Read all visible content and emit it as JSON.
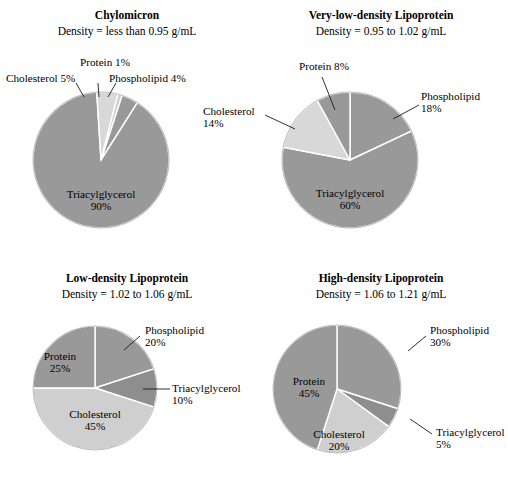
{
  "figure": {
    "background": "#ffffff",
    "palette": {
      "medium_gray": "#999999",
      "light_gray": "#cfcfcf",
      "lighter_gray": "#d8d8d8",
      "divider": "#ffffff",
      "text": "#000000",
      "leader_line": "#1a1a1a"
    }
  },
  "chart_data": [
    {
      "type": "pie",
      "id": "chylomicron",
      "title": "Chylomicron",
      "subtitle": "Density = less than 0.95 g/mL",
      "categories": [
        "Phospholipid",
        "Triacylglycerol",
        "Cholesterol",
        "Protein"
      ],
      "values": [
        4,
        90,
        5,
        1
      ],
      "labels": [
        "Phospholipid 4%",
        "Triacylglycerol 90%",
        "Cholesterol 5%",
        "Protein 1%"
      ],
      "colors": [
        "#999999",
        "#999999",
        "#d8d8d8",
        "#cfcfcf"
      ],
      "start_angle_deg": 18,
      "center": [
        101,
        160
      ],
      "radius": 68,
      "units": "percent",
      "total": 100
    },
    {
      "type": "pie",
      "id": "vldl",
      "title": "Very-low-density Lipoprotein",
      "subtitle": "Density =  0.95 to 1.02 g/mL",
      "categories": [
        "Phospholipid",
        "Triacylglycerol",
        "Cholesterol",
        "Protein"
      ],
      "values": [
        18,
        60,
        14,
        8
      ],
      "labels": [
        "Phospholipid 18%",
        "Triacylglycerol 60%",
        "Cholesterol 14%",
        "Protein 8%"
      ],
      "colors": [
        "#999999",
        "#999999",
        "#d8d8d8",
        "#999999"
      ],
      "start_angle_deg": 0,
      "center": [
        350,
        160
      ],
      "radius": 68,
      "units": "percent",
      "total": 100
    },
    {
      "type": "pie",
      "id": "ldl",
      "title": "Low-density Lipoprotein",
      "subtitle": "Density = 1.02 to 1.06 g/mL",
      "categories": [
        "Phospholipid",
        "Triacylglycerol",
        "Cholesterol",
        "Protein"
      ],
      "values": [
        20,
        10,
        45,
        25
      ],
      "labels": [
        "Phospholipid 20%",
        "Triacylglycerol 10%",
        "Cholesterol 45%",
        "Protein 25%"
      ],
      "colors": [
        "#999999",
        "#8e8e8e",
        "#cfcfcf",
        "#999999"
      ],
      "start_angle_deg": 0,
      "center": [
        95,
        388
      ],
      "radius": 62,
      "units": "percent",
      "total": 100
    },
    {
      "type": "pie",
      "id": "hdl",
      "title": "High-density Lipoprotein",
      "subtitle": "Density =  1.06 to 1.21 g/mL",
      "categories": [
        "Phospholipid",
        "Triacylglycerol",
        "Cholesterol",
        "Protein"
      ],
      "values": [
        30,
        5,
        20,
        45
      ],
      "labels": [
        "Phospholipid 30%",
        "Triacylglycerol 5%",
        "Cholesterol 20%",
        "Protein 45%"
      ],
      "colors": [
        "#999999",
        "#8e8e8e",
        "#cfcfcf",
        "#999999"
      ],
      "start_angle_deg": 0,
      "center": [
        337,
        389
      ],
      "radius": 64,
      "units": "percent",
      "total": 100
    }
  ],
  "panels": {
    "chylomicron": {
      "title": "Chylomicron",
      "density": "Density = less than 0.95 g/mL",
      "annotations": {
        "protein": {
          "name": "Protein",
          "pct": "1%",
          "text": "Protein 1%"
        },
        "cholesterol": {
          "name": "Cholesterol",
          "pct": "5%",
          "text": "Cholesterol 5%"
        },
        "phospholipid": {
          "name": "Phospholipid",
          "pct": "4%",
          "text": "Phospholipid 4%"
        },
        "triacylglycerol": {
          "name": "Triacylglycerol",
          "pct": "90%"
        }
      }
    },
    "vldl": {
      "title": "Very-low-density Lipoprotein",
      "density": "Density =  0.95 to 1.02 g/mL",
      "annotations": {
        "protein": {
          "name": "Protein",
          "pct": "8%",
          "text": "Protein 8%"
        },
        "cholesterol": {
          "name": "Cholesterol",
          "pct": "14%"
        },
        "phospholipid": {
          "name": "Phospholipid",
          "pct": "18%"
        },
        "triacylglycerol": {
          "name": "Triacylglycerol",
          "pct": "60%"
        }
      }
    },
    "ldl": {
      "title": "Low-density Lipoprotein",
      "density": "Density = 1.02 to 1.06 g/mL",
      "annotations": {
        "protein": {
          "name": "Protein",
          "pct": "25%"
        },
        "cholesterol": {
          "name": "Cholesterol",
          "pct": "45%"
        },
        "phospholipid": {
          "name": "Phospholipid",
          "pct": "20%"
        },
        "triacylglycerol": {
          "name": "Triacylglycerol",
          "pct": "10%"
        }
      }
    },
    "hdl": {
      "title": "High-density Lipoprotein",
      "density": "Density =  1.06 to 1.21 g/mL",
      "annotations": {
        "protein": {
          "name": "Protein",
          "pct": "45%"
        },
        "cholesterol": {
          "name": "Cholesterol",
          "pct": "20%"
        },
        "phospholipid": {
          "name": "Phospholipid",
          "pct": "30%"
        },
        "triacylglycerol": {
          "name": "Triacylglycerol",
          "pct": "5%"
        }
      }
    }
  }
}
